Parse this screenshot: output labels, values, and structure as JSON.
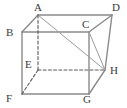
{
  "figure": {
    "type": "geometry-diagram",
    "shape": "cube",
    "canvas": {
      "width": 127,
      "height": 108,
      "background": "#ffffff"
    },
    "style": {
      "solid_edge_color": "#8a8a8a",
      "hidden_edge_color": "#5a5a5a",
      "diagonal_color": "#9a9a9a",
      "label_color": "#3a3a3a",
      "solid_edge_width": 1.4,
      "hidden_edge_width": 1.1,
      "diagonal_width": 1.0,
      "hidden_dash_pattern": "3,2.2"
    },
    "vertices": [
      {
        "id": "A",
        "label": "A",
        "x": 38,
        "y": 15,
        "hidden": false,
        "label_x": 34,
        "label_y": 2
      },
      {
        "id": "B",
        "label": "B",
        "x": 22,
        "y": 32,
        "hidden": false,
        "label_x": 6,
        "label_y": 27
      },
      {
        "id": "C",
        "label": "C",
        "x": 89,
        "y": 32,
        "hidden": false,
        "label_x": 82,
        "label_y": 19
      },
      {
        "id": "D",
        "label": "D",
        "x": 112,
        "y": 15,
        "hidden": false,
        "label_x": 112,
        "label_y": 2
      },
      {
        "id": "E",
        "label": "E",
        "x": 38,
        "y": 70,
        "hidden": true,
        "label_x": 25,
        "label_y": 59
      },
      {
        "id": "F",
        "label": "F",
        "x": 22,
        "y": 94,
        "hidden": false,
        "label_x": 6,
        "label_y": 93
      },
      {
        "id": "G",
        "label": "G",
        "x": 89,
        "y": 94,
        "hidden": false,
        "label_x": 83,
        "label_y": 94
      },
      {
        "id": "H",
        "label": "H",
        "x": 105,
        "y": 70,
        "hidden": false,
        "label_x": 110,
        "label_y": 65
      }
    ],
    "edges": [
      {
        "id": "AB",
        "from": "A",
        "to": "B",
        "kind": "solid"
      },
      {
        "id": "AD",
        "from": "A",
        "to": "D",
        "kind": "solid"
      },
      {
        "id": "BC",
        "from": "B",
        "to": "C",
        "kind": "solid"
      },
      {
        "id": "CD",
        "from": "C",
        "to": "D",
        "kind": "solid"
      },
      {
        "id": "BF",
        "from": "B",
        "to": "F",
        "kind": "solid"
      },
      {
        "id": "CG",
        "from": "C",
        "to": "G",
        "kind": "solid"
      },
      {
        "id": "DH",
        "from": "D",
        "to": "H",
        "kind": "solid"
      },
      {
        "id": "FG",
        "from": "F",
        "to": "G",
        "kind": "solid"
      },
      {
        "id": "GH",
        "from": "G",
        "to": "H",
        "kind": "solid"
      },
      {
        "id": "AE",
        "from": "A",
        "to": "E",
        "kind": "hidden"
      },
      {
        "id": "EF",
        "from": "E",
        "to": "F",
        "kind": "hidden"
      },
      {
        "id": "EH",
        "from": "E",
        "to": "H",
        "kind": "hidden"
      }
    ],
    "diagonals": [
      {
        "id": "AH",
        "from": "A",
        "to": "H",
        "kind": "diagonal"
      },
      {
        "id": "CH",
        "from": "C",
        "to": "H",
        "kind": "diagonal"
      }
    ]
  }
}
